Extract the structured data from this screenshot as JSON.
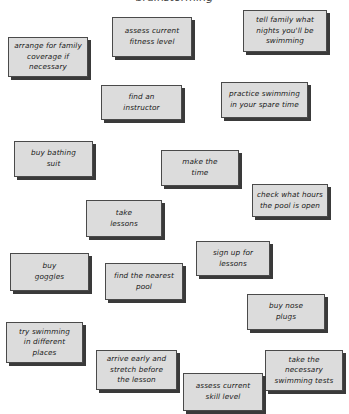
{
  "diagram": {
    "title": "brainstorming",
    "background_color": "#ffffff",
    "card_fill_color": "#dcdcdc",
    "card_border_color": "#4a4a4a",
    "card_shadow_color": "#3a3a3a",
    "text_color": "#1a1a1a",
    "card_count": 16,
    "cards": [
      {
        "id": "arrange-for-family-coverage",
        "text": "arrange for family\ncoverage if\nnecessary",
        "x": 8,
        "y": 37,
        "width": 80,
        "height": 40
      },
      {
        "id": "assess-current-fitness-level",
        "text": "assess current\nfitness level",
        "x": 112,
        "y": 17,
        "width": 80,
        "height": 40
      },
      {
        "id": "tell-family-what-nights",
        "text": "tell family what\nnights you'll be\nswimming",
        "x": 243,
        "y": 10,
        "width": 84,
        "height": 42
      },
      {
        "id": "find-an-instructor",
        "text": "find an\ninstructor",
        "x": 101,
        "y": 85,
        "width": 81,
        "height": 35
      },
      {
        "id": "practice-swimming-spare-time",
        "text": "practice swimming\nin your spare time",
        "x": 221,
        "y": 82,
        "width": 87,
        "height": 36
      },
      {
        "id": "buy-bathing-suit",
        "text": "buy bathing\nsuit",
        "x": 14,
        "y": 141,
        "width": 79,
        "height": 36
      },
      {
        "id": "make-the-time",
        "text": "make the\ntime",
        "x": 161,
        "y": 150,
        "width": 78,
        "height": 36
      },
      {
        "id": "check-what-hours-pool-open",
        "text": "check what hours\nthe pool is open",
        "x": 252,
        "y": 184,
        "width": 76,
        "height": 33
      },
      {
        "id": "take-lessons",
        "text": "take\nlessons",
        "x": 86,
        "y": 200,
        "width": 76,
        "height": 37
      },
      {
        "id": "sign-up-for-lessons",
        "text": "sign up for\nlessons",
        "x": 196,
        "y": 241,
        "width": 74,
        "height": 35
      },
      {
        "id": "buy-goggles",
        "text": "buy\ngoggles",
        "x": 10,
        "y": 253,
        "width": 79,
        "height": 38
      },
      {
        "id": "find-the-nearest-pool",
        "text": "find the nearest\npool",
        "x": 105,
        "y": 263,
        "width": 78,
        "height": 37
      },
      {
        "id": "buy-nose-plugs",
        "text": "buy nose\nplugs",
        "x": 247,
        "y": 294,
        "width": 78,
        "height": 36
      },
      {
        "id": "try-swimming-different-places",
        "text": "try swimming\nin different\nplaces",
        "x": 6,
        "y": 322,
        "width": 77,
        "height": 41
      },
      {
        "id": "arrive-early-and-stretch",
        "text": "arrive early and\nstretch before\nthe lesson",
        "x": 96,
        "y": 350,
        "width": 81,
        "height": 40
      },
      {
        "id": "take-necessary-swimming-tests",
        "text": "take the\nnecessary\nswimming tests",
        "x": 265,
        "y": 350,
        "width": 78,
        "height": 41
      },
      {
        "id": "assess-current-skill-level",
        "text": "assess current\nskill level",
        "x": 183,
        "y": 373,
        "width": 80,
        "height": 38
      }
    ]
  }
}
